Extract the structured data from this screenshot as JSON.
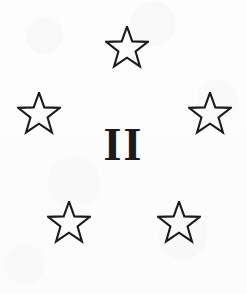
{
  "emblem": {
    "title": "Star Emblem II",
    "numeral": "II",
    "numeral_icon": "roman-numeral-two",
    "ink_color": "#1b1b1b",
    "background_color": "#fdfdfd",
    "star_count": 5,
    "star_style": "outline",
    "star_points": 5,
    "stars": [
      {
        "name": "star-top",
        "label": "Star",
        "icon": "five-pointed-star-outline",
        "x": 105,
        "y": 26,
        "size": 44
      },
      {
        "name": "star-left",
        "label": "Star",
        "icon": "five-pointed-star-outline",
        "x": 17,
        "y": 92,
        "size": 44
      },
      {
        "name": "star-right",
        "label": "Star",
        "icon": "five-pointed-star-outline",
        "x": 188,
        "y": 92,
        "size": 44
      },
      {
        "name": "star-bottom-left",
        "label": "Star",
        "icon": "five-pointed-star-outline",
        "x": 47,
        "y": 201,
        "size": 44
      },
      {
        "name": "star-bottom-right",
        "label": "Star",
        "icon": "five-pointed-star-outline",
        "x": 157,
        "y": 201,
        "size": 44
      }
    ]
  }
}
